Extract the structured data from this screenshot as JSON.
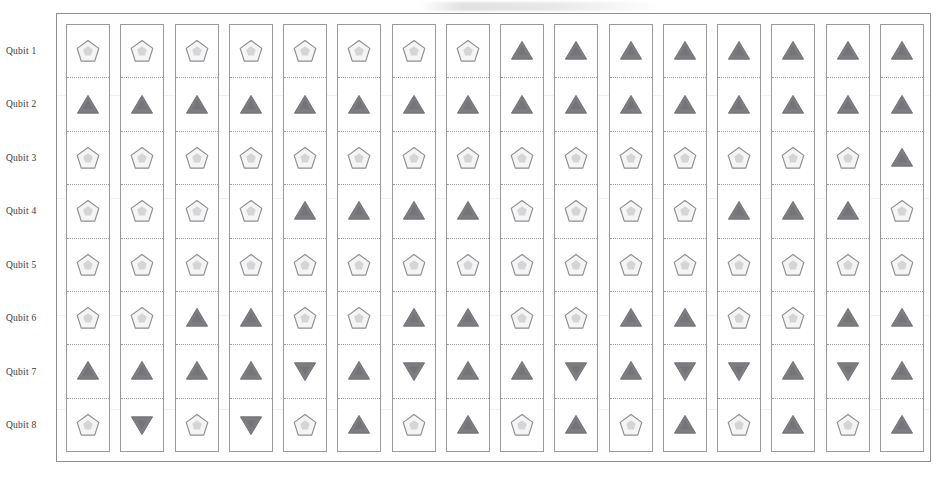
{
  "figure": {
    "kind": "quantum-circuit-gate-grid",
    "rows": 8,
    "columns": 16,
    "colors": {
      "pentagon_fill": "#f5f5f6",
      "pentagon_stroke": "#8f8f93",
      "pentagon_inner": "#b9b9bd",
      "triangle_fill": "#7d7d82",
      "triangle_stroke": "#6e6e73",
      "frame_stroke": "#8e8e90",
      "column_stroke": "#9a9a9c",
      "cell_divider": "#9d9d9f",
      "label_text": "#3a3a3c",
      "page_background": "#ffffff"
    }
  },
  "row_labels": [
    "Qubit 1",
    "Qubit 2",
    "Qubit 3",
    "Qubit 4",
    "Qubit 5",
    "Qubit 6",
    "Qubit 7",
    "Qubit 8"
  ],
  "glyph_legend": {
    "pentagon": "pentagon-marker",
    "triangle_up": "triangle-up-marker",
    "triangle_down": "triangle-down-marker"
  },
  "chart_data": {
    "type": "heatmap",
    "title": "",
    "xlabel": "",
    "ylabel": "",
    "grid": true,
    "legend": "none",
    "categories_x": [
      1,
      2,
      3,
      4,
      5,
      6,
      7,
      8,
      9,
      10,
      11,
      12,
      13,
      14,
      15,
      16
    ],
    "categories_y": [
      "Qubit 1",
      "Qubit 2",
      "Qubit 3",
      "Qubit 4",
      "Qubit 5",
      "Qubit 6",
      "Qubit 7",
      "Qubit 8"
    ],
    "marker_codes": {
      "P": "pentagon",
      "U": "triangle_up",
      "D": "triangle_down"
    },
    "cells": [
      [
        "P",
        "P",
        "P",
        "P",
        "P",
        "P",
        "P",
        "P",
        "U",
        "U",
        "U",
        "U",
        "U",
        "U",
        "U",
        "U"
      ],
      [
        "U",
        "U",
        "U",
        "U",
        "U",
        "U",
        "U",
        "U",
        "U",
        "U",
        "U",
        "U",
        "U",
        "U",
        "U",
        "U"
      ],
      [
        "P",
        "P",
        "P",
        "P",
        "P",
        "P",
        "P",
        "P",
        "P",
        "P",
        "P",
        "P",
        "P",
        "P",
        "P",
        "U"
      ],
      [
        "P",
        "P",
        "P",
        "P",
        "U",
        "U",
        "U",
        "U",
        "P",
        "P",
        "P",
        "P",
        "U",
        "U",
        "U",
        "P"
      ],
      [
        "P",
        "P",
        "P",
        "P",
        "P",
        "P",
        "P",
        "P",
        "P",
        "P",
        "P",
        "P",
        "P",
        "P",
        "P",
        "P"
      ],
      [
        "P",
        "P",
        "U",
        "U",
        "P",
        "P",
        "U",
        "U",
        "P",
        "P",
        "U",
        "U",
        "P",
        "P",
        "U",
        "U"
      ],
      [
        "U",
        "U",
        "U",
        "U",
        "D",
        "U",
        "D",
        "U",
        "U",
        "D",
        "U",
        "D",
        "D",
        "U",
        "D",
        "U"
      ],
      [
        "P",
        "D",
        "P",
        "D",
        "P",
        "U",
        "P",
        "U",
        "P",
        "U",
        "P",
        "U",
        "P",
        "U",
        "P",
        "U"
      ]
    ]
  }
}
